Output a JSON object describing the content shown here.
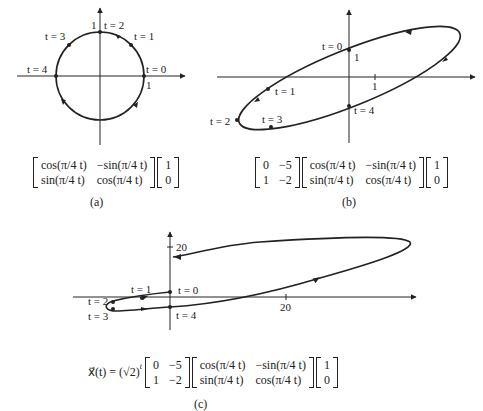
{
  "figure": {
    "panels": [
      {
        "id": "a",
        "caption": "(a)",
        "matrix_rot": [
          [
            "cos(π/4 t)",
            "−sin(π/4 t)"
          ],
          [
            "sin(π/4 t)",
            "cos(π/4 t)"
          ]
        ],
        "vector": [
          "1",
          "0"
        ],
        "labels": {
          "t0": "t = 0",
          "t1": "t = 1",
          "t2": "t = 2",
          "t3": "t = 3",
          "t4": "t = 4",
          "tick_x": "1",
          "tick_y": "1"
        }
      },
      {
        "id": "b",
        "caption": "(b)",
        "matrix_A": [
          [
            "0",
            "−5"
          ],
          [
            "1",
            "−2"
          ]
        ],
        "matrix_rot": [
          [
            "cos(π/4 t)",
            "−sin(π/4 t)"
          ],
          [
            "sin(π/4 t)",
            "cos(π/4 t)"
          ]
        ],
        "vector": [
          "1",
          "0"
        ],
        "labels": {
          "t0": "t = 0",
          "t1": "t = 1",
          "t2": "t = 2",
          "t3": "t = 3",
          "t4": "t = 4",
          "tick_x": "1",
          "tick_y": "1"
        }
      },
      {
        "id": "c",
        "caption": "(c)",
        "prefix": "x⃗(t) = (√2)",
        "exponent": "t",
        "matrix_A": [
          [
            "0",
            "−5"
          ],
          [
            "1",
            "−2"
          ]
        ],
        "matrix_rot": [
          [
            "cos(π/4 t)",
            "−sin(π/4 t)"
          ],
          [
            "sin(π/4 t)",
            "cos(π/4 t)"
          ]
        ],
        "vector": [
          "1",
          "0"
        ],
        "labels": {
          "t0": "t = 0",
          "t1": "t = 1",
          "t2": "t = 2",
          "t3": "t = 3",
          "t4": "t = 4",
          "tick_x": "20",
          "tick_y": "20"
        }
      }
    ]
  }
}
